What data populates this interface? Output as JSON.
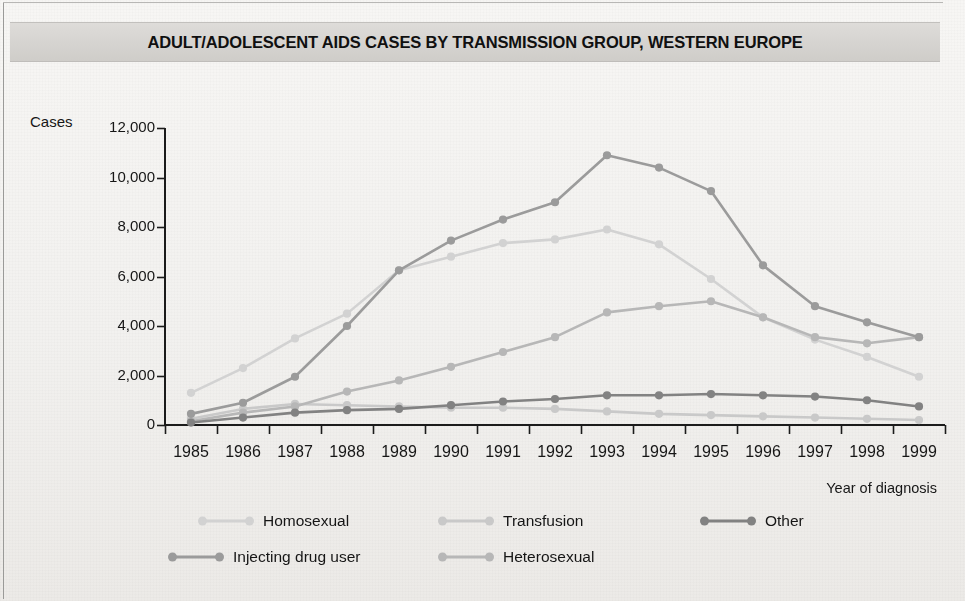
{
  "title": "ADULT/ADOLESCENT AIDS CASES BY TRANSMISSION GROUP, WESTERN EUROPE",
  "axes": {
    "y_axis_name": "Cases",
    "x_axis_title": "Year of diagnosis"
  },
  "legend": {
    "items": [
      {
        "label": "Homosexual",
        "color": "#d2d2d2"
      },
      {
        "label": "Transfusion",
        "color": "#c9c9c9"
      },
      {
        "label": "Other",
        "color": "#828282"
      },
      {
        "label": "Injecting drug user",
        "color": "#9b9b9b"
      },
      {
        "label": "Heterosexual",
        "color": "#b7b7b7"
      }
    ]
  },
  "chart_data": {
    "type": "line",
    "title": "ADULT/ADOLESCENT AIDS CASES BY TRANSMISSION GROUP, WESTERN EUROPE",
    "xlabel": "Year of diagnosis",
    "ylabel": "Cases",
    "x": [
      1985,
      1986,
      1987,
      1988,
      1989,
      1990,
      1991,
      1992,
      1993,
      1994,
      1995,
      1996,
      1997,
      1998,
      1999
    ],
    "categories": [
      "1985",
      "1986",
      "1987",
      "1988",
      "1989",
      "1990",
      "1991",
      "1992",
      "1993",
      "1994",
      "1995",
      "1996",
      "1997",
      "1998",
      "1999"
    ],
    "ylim": [
      0,
      12000
    ],
    "yticks": [
      0,
      2000,
      4000,
      6000,
      8000,
      10000,
      12000
    ],
    "ytick_labels": [
      "0",
      "2,000",
      "4,000",
      "6,000",
      "8,000",
      "10,000",
      "12,000"
    ],
    "grid": false,
    "legend_position": "bottom",
    "markers": true,
    "series": [
      {
        "name": "Homosexual",
        "color": "#d2d2d2",
        "values": [
          1300,
          2300,
          3500,
          4500,
          6250,
          6800,
          7350,
          7500,
          7900,
          7300,
          5900,
          4350,
          3450,
          2750,
          1950
        ]
      },
      {
        "name": "Injecting drug user",
        "color": "#9b9b9b",
        "values": [
          450,
          900,
          1950,
          4000,
          6250,
          7450,
          8300,
          9000,
          10900,
          10400,
          9450,
          6450,
          4800,
          4150,
          3550
        ]
      },
      {
        "name": "Heterosexual",
        "color": "#b7b7b7",
        "values": [
          150,
          500,
          750,
          1350,
          1800,
          2350,
          2950,
          3550,
          4550,
          4800,
          5000,
          4350,
          3550,
          3300,
          3550
        ]
      },
      {
        "name": "Other",
        "color": "#828282",
        "values": [
          100,
          300,
          500,
          600,
          650,
          800,
          950,
          1050,
          1200,
          1200,
          1250,
          1200,
          1150,
          1000,
          750
        ]
      },
      {
        "name": "Transfusion",
        "color": "#c9c9c9",
        "values": [
          250,
          650,
          850,
          800,
          750,
          700,
          700,
          650,
          550,
          450,
          400,
          350,
          300,
          250,
          200
        ]
      }
    ]
  }
}
